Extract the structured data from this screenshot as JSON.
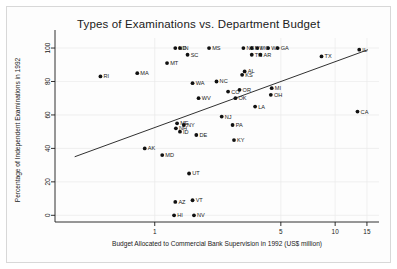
{
  "chart_data": {
    "type": "scatter",
    "title": "Types of Examinations vs. Department Budget",
    "xlabel": "Budget Allocated to Commercial Bank Supervision in 1992 (US$ million)",
    "ylabel": "Percentage of Independent Examinations in 1992",
    "xscale": "log",
    "xlim": [
      0.28,
      17.5
    ],
    "ylim": [
      -4,
      106
    ],
    "xticks": [
      1,
      5,
      10,
      15
    ],
    "xtick_labels": [
      "1",
      "5",
      "10",
      "15"
    ],
    "yticks": [
      0,
      20,
      40,
      60,
      80,
      100
    ],
    "ytick_labels": [
      "0",
      "20",
      "40",
      "60",
      "80",
      "100"
    ],
    "grid": true,
    "legend": "none",
    "point_label_field": "state",
    "regression_line": {
      "label": "fitted line",
      "x_start": 0.36,
      "y_start": 35.0,
      "x_end": 15.2,
      "y_end": 99.0
    },
    "points": [
      {
        "state": "RI",
        "x": 0.5,
        "y": 83
      },
      {
        "state": "ND",
        "x": 1.3,
        "y": 100
      },
      {
        "state": "IN",
        "x": 1.38,
        "y": 100
      },
      {
        "state": "SC",
        "x": 1.52,
        "y": 96
      },
      {
        "state": "MT",
        "x": 1.17,
        "y": 91
      },
      {
        "state": "MS",
        "x": 2.0,
        "y": 100
      },
      {
        "state": "MA",
        "x": 0.8,
        "y": 85
      },
      {
        "state": "WA",
        "x": 1.62,
        "y": 79
      },
      {
        "state": "NC",
        "x": 2.2,
        "y": 80
      },
      {
        "state": "NE",
        "x": 3.1,
        "y": 100
      },
      {
        "state": "NV2",
        "x": 3.45,
        "y": 100
      },
      {
        "state": "MO",
        "x": 3.7,
        "y": 100
      },
      {
        "state": "WI",
        "x": 4.25,
        "y": 100
      },
      {
        "state": "GA",
        "x": 4.8,
        "y": 100
      },
      {
        "state": "TN",
        "x": 3.45,
        "y": 96
      },
      {
        "state": "AR",
        "x": 3.85,
        "y": 96
      },
      {
        "state": "TX",
        "x": 8.4,
        "y": 95
      },
      {
        "state": "IL",
        "x": 13.6,
        "y": 99
      },
      {
        "state": "AL",
        "x": 3.15,
        "y": 86
      },
      {
        "state": "KS",
        "x": 3.05,
        "y": 84
      },
      {
        "state": "WV",
        "x": 1.75,
        "y": 70
      },
      {
        "state": "CO",
        "x": 2.55,
        "y": 74
      },
      {
        "state": "OR",
        "x": 2.95,
        "y": 75
      },
      {
        "state": "OK",
        "x": 2.8,
        "y": 70
      },
      {
        "state": "MI",
        "x": 4.45,
        "y": 76
      },
      {
        "state": "OH",
        "x": 4.4,
        "y": 72
      },
      {
        "state": "LA",
        "x": 3.6,
        "y": 65
      },
      {
        "state": "CA",
        "x": 13.3,
        "y": 62
      },
      {
        "state": "NJ",
        "x": 2.35,
        "y": 59
      },
      {
        "state": "ME",
        "x": 1.33,
        "y": 55
      },
      {
        "state": "NY",
        "x": 1.45,
        "y": 54
      },
      {
        "state": "NH",
        "x": 1.31,
        "y": 52
      },
      {
        "state": "ID",
        "x": 1.38,
        "y": 50
      },
      {
        "state": "DE",
        "x": 1.7,
        "y": 48
      },
      {
        "state": "PA",
        "x": 2.7,
        "y": 54
      },
      {
        "state": "KY",
        "x": 2.75,
        "y": 45
      },
      {
        "state": "AK",
        "x": 0.88,
        "y": 40
      },
      {
        "state": "MD",
        "x": 1.1,
        "y": 36
      },
      {
        "state": "UT",
        "x": 1.55,
        "y": 25
      },
      {
        "state": "AZ",
        "x": 1.3,
        "y": 8
      },
      {
        "state": "VT",
        "x": 1.62,
        "y": 9
      },
      {
        "state": "HI",
        "x": 1.28,
        "y": 0
      },
      {
        "state": "NV",
        "x": 1.65,
        "y": 0
      }
    ]
  }
}
